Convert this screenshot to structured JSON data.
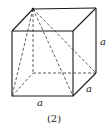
{
  "figure": {
    "caption": "(2)",
    "labels": {
      "front_bottom_edge": "a",
      "right_depth_edge": "a",
      "right_vertical_edge": "a"
    },
    "colors": {
      "line": "#1a1a1a",
      "background": "#ffffff"
    }
  }
}
